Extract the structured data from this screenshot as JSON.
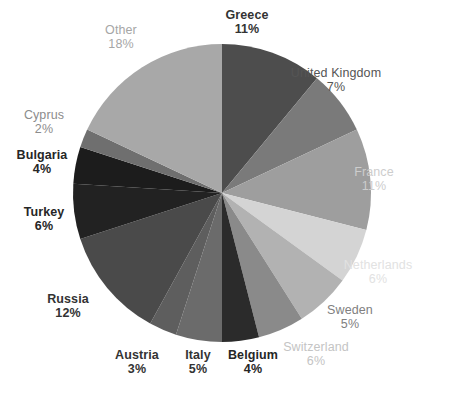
{
  "chart_data": {
    "type": "pie",
    "title": "",
    "subtitle": "",
    "xlabel": "",
    "ylabel": "",
    "legend_position": "none",
    "grid": false,
    "start_angle_deg": 0,
    "direction": "clockwise",
    "total_percent": 100,
    "categories": [
      "Greece",
      "United Kingdom",
      "France",
      "Netherlands",
      "Switzerland",
      "Sweden",
      "Belgium",
      "Italy",
      "Austria",
      "Russia",
      "Turkey",
      "Bulgaria",
      "Cyprus",
      "Other"
    ],
    "values": [
      11,
      7,
      11,
      6,
      6,
      5,
      4,
      5,
      3,
      12,
      6,
      4,
      2,
      18
    ],
    "slices": [
      {
        "name": "Greece",
        "percent": 11,
        "percent_label": "11%",
        "color": "#4d4d4d",
        "label_color": "#333333",
        "label_weight": "bold",
        "label_x": 247,
        "label_y": 8,
        "label_align": "center"
      },
      {
        "name": "United Kingdom",
        "percent": 7,
        "percent_label": "7%",
        "color": "#7a7a7a",
        "label_color": "#555555",
        "label_weight": "normal",
        "label_x": 336,
        "label_y": 66,
        "label_align": "center"
      },
      {
        "name": "France",
        "percent": 11,
        "percent_label": "11%",
        "color": "#9e9e9e",
        "label_color": "#cdcdcd",
        "label_weight": "normal",
        "label_x": 374,
        "label_y": 165,
        "label_align": "center"
      },
      {
        "name": "Netherlands",
        "percent": 6,
        "percent_label": "6%",
        "color": "#d4d4d4",
        "label_color": "#e2e2e2",
        "label_weight": "normal",
        "label_x": 378,
        "label_y": 258,
        "label_align": "center"
      },
      {
        "name": "Switzerland",
        "percent": 6,
        "percent_label": "6%",
        "color": "#b2b2b2",
        "label_color": "#c4c4c4",
        "label_weight": "normal",
        "label_x": 316,
        "label_y": 340,
        "label_align": "center"
      },
      {
        "name": "Sweden",
        "percent": 5,
        "percent_label": "5%",
        "color": "#8a8a8a",
        "label_color": "#808080",
        "label_weight": "normal",
        "label_x": 350,
        "label_y": 303,
        "label_align": "center"
      },
      {
        "name": "Belgium",
        "percent": 4,
        "percent_label": "4%",
        "color": "#2b2b2b",
        "label_color": "#262626",
        "label_weight": "bold",
        "label_x": 253,
        "label_y": 348,
        "label_align": "center"
      },
      {
        "name": "Italy",
        "percent": 5,
        "percent_label": "5%",
        "color": "#6b6b6b",
        "label_color": "#333333",
        "label_weight": "bold",
        "label_x": 198,
        "label_y": 348,
        "label_align": "center"
      },
      {
        "name": "Austria",
        "percent": 3,
        "percent_label": "3%",
        "color": "#5e5e5e",
        "label_color": "#333333",
        "label_weight": "bold",
        "label_x": 137,
        "label_y": 348,
        "label_align": "center"
      },
      {
        "name": "Russia",
        "percent": 12,
        "percent_label": "12%",
        "color": "#4a4a4a",
        "label_color": "#333333",
        "label_weight": "bold",
        "label_x": 68,
        "label_y": 292,
        "label_align": "center"
      },
      {
        "name": "Turkey",
        "percent": 6,
        "percent_label": "6%",
        "color": "#222222",
        "label_color": "#262626",
        "label_weight": "bold",
        "label_x": 44,
        "label_y": 205,
        "label_align": "center"
      },
      {
        "name": "Bulgaria",
        "percent": 4,
        "percent_label": "4%",
        "color": "#1c1c1c",
        "label_color": "#262626",
        "label_weight": "bold",
        "label_x": 42,
        "label_y": 148,
        "label_align": "center"
      },
      {
        "name": "Cyprus",
        "percent": 2,
        "percent_label": "2%",
        "color": "#6f6f6f",
        "label_color": "#8c8c8c",
        "label_weight": "normal",
        "label_x": 44,
        "label_y": 108,
        "label_align": "center"
      },
      {
        "name": "Other",
        "percent": 18,
        "percent_label": "18%",
        "color": "#a8a8a8",
        "label_color": "#a6a6a6",
        "label_weight": "normal",
        "label_x": 121,
        "label_y": 23,
        "label_align": "center"
      }
    ],
    "geometry": {
      "center_x": 222,
      "center_y": 193,
      "radius": 149
    }
  },
  "caption": {
    "text": ""
  }
}
